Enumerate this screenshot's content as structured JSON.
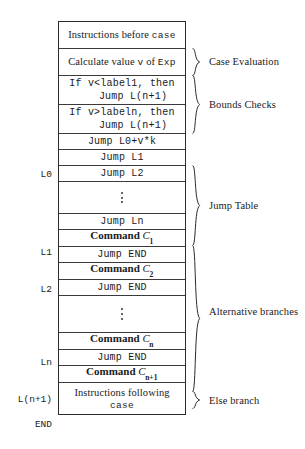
{
  "figure": {
    "type": "code-layout-diagram"
  },
  "box": {
    "rows": [
      {
        "id": "instructions-before-case",
        "style": "mixed-serif",
        "lines": [
          {
            "parts": [
              {
                "text": "Instructions before ",
                "kind": "serif"
              },
              {
                "text": "case",
                "kind": "mono"
              }
            ]
          }
        ]
      },
      {
        "id": "calculate-value",
        "style": "mixed-serif",
        "lines": [
          {
            "parts": [
              {
                "text": "Calculate value ",
                "kind": "serif"
              },
              {
                "text": "v",
                "kind": "mono"
              },
              {
                "text": " of ",
                "kind": "serif"
              },
              {
                "text": "Exp",
                "kind": "mono"
              }
            ]
          }
        ]
      },
      {
        "id": "lower-bound-check",
        "style": "mono",
        "lines": [
          {
            "text": "If v<label1, then"
          },
          {
            "text": "Jump L(n+1)"
          }
        ]
      },
      {
        "id": "upper-bound-check",
        "style": "mono",
        "lines": [
          {
            "text": "If v>labeln, then"
          },
          {
            "text": "Jump L(n+1)"
          }
        ]
      },
      {
        "id": "indexed-jump",
        "style": "mono",
        "lines": [
          {
            "text": "Jump L0+v*k"
          }
        ]
      },
      {
        "id": "jump-l1",
        "style": "mono",
        "lines": [
          {
            "text": "Jump L1"
          }
        ]
      },
      {
        "id": "jump-l2",
        "style": "mono",
        "lines": [
          {
            "text": "Jump L2"
          }
        ]
      },
      {
        "id": "jump-table-ellipsis",
        "style": "ellipsis",
        "lines": []
      },
      {
        "id": "jump-ln",
        "style": "mono",
        "lines": [
          {
            "text": "Jump Ln"
          }
        ]
      },
      {
        "id": "command-c1",
        "style": "command",
        "command_word": "Command",
        "symbol": "C",
        "subscript": "1"
      },
      {
        "id": "jump-end-1",
        "style": "mono",
        "lines": [
          {
            "text": "Jump END"
          }
        ]
      },
      {
        "id": "command-c2",
        "style": "command",
        "command_word": "Command",
        "symbol": "C",
        "subscript": "2"
      },
      {
        "id": "jump-end-2",
        "style": "mono",
        "lines": [
          {
            "text": "Jump END"
          }
        ]
      },
      {
        "id": "branches-ellipsis",
        "style": "ellipsis",
        "lines": []
      },
      {
        "id": "command-cn",
        "style": "command",
        "command_word": "Command",
        "symbol": "C",
        "subscript": "n"
      },
      {
        "id": "jump-end-n",
        "style": "mono",
        "lines": [
          {
            "text": "Jump END"
          }
        ]
      },
      {
        "id": "command-cn1",
        "style": "command",
        "command_word": "Command",
        "symbol": "C",
        "subscript": "n+1"
      },
      {
        "id": "instructions-following-case",
        "style": "mixed-serif",
        "lines": [
          {
            "parts": [
              {
                "text": "Instructions following",
                "kind": "serif"
              }
            ]
          },
          {
            "parts": [
              {
                "text": "case",
                "kind": "mono"
              }
            ]
          }
        ]
      }
    ]
  },
  "row_labels": [
    {
      "id": "label-l0",
      "text": "L0"
    },
    {
      "id": "label-l1",
      "text": "L1"
    },
    {
      "id": "label-l2",
      "text": "L2"
    },
    {
      "id": "label-ln",
      "text": "Ln"
    },
    {
      "id": "label-ln1",
      "text": "L(n+1)"
    },
    {
      "id": "label-end",
      "text": "END"
    }
  ],
  "annotations": [
    {
      "id": "case-evaluation",
      "text": "Case Evaluation"
    },
    {
      "id": "bounds-checks",
      "text": "Bounds Checks"
    },
    {
      "id": "jump-table",
      "text": "Jump Table"
    },
    {
      "id": "alternative-branches",
      "text": "Alternative branches"
    },
    {
      "id": "else-branch",
      "text": "Else branch"
    }
  ],
  "colors": {
    "ink": "#1a1a1a",
    "border": "#2b2b2b",
    "rule": "#3a3a3a",
    "background": "#ffffff"
  }
}
